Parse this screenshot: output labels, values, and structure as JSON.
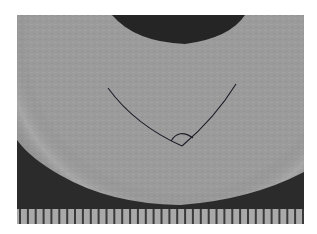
{
  "figure": {
    "colors": {
      "background": "#ffffff",
      "disc": "#9a9a9a",
      "disc_edge": "#b4b4b4",
      "dark_region": "#2a2a2a",
      "overlay_line": "#1a1a2a",
      "ruler_bg": "#a8a8a8",
      "ruler_tick": "#3a3a3a"
    },
    "overlay": {
      "type": "angle-measurement",
      "vertex": [
        182,
        146
      ],
      "arm_left_end": [
        108,
        88
      ],
      "arm_right_end": [
        236,
        84
      ]
    },
    "ruler": {
      "tick_count": 37
    }
  }
}
